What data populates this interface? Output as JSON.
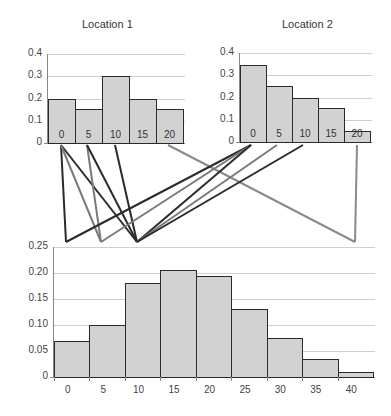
{
  "chart_data": [
    {
      "type": "bar",
      "title": "Location 1",
      "categories": [
        "0",
        "5",
        "10",
        "15",
        "20"
      ],
      "values": [
        0.2,
        0.155,
        0.3,
        0.2,
        0.155
      ],
      "yticks": [
        "0",
        "0.1",
        "0.2",
        "0.3",
        "0.4"
      ],
      "ylim": [
        0,
        0.4
      ],
      "grid": true,
      "xlabel": "",
      "ylabel": ""
    },
    {
      "type": "bar",
      "title": "Location 2",
      "categories": [
        "0",
        "5",
        "10",
        "15",
        "20"
      ],
      "values": [
        0.345,
        0.25,
        0.2,
        0.155,
        0.05
      ],
      "yticks": [
        "0",
        "0.1",
        "0.2",
        "0.3",
        "0.4"
      ],
      "ylim": [
        0,
        0.4
      ],
      "grid": true,
      "xlabel": "",
      "ylabel": ""
    },
    {
      "type": "bar",
      "title": "",
      "categories": [
        "0",
        "5",
        "10",
        "15",
        "20",
        "25",
        "30",
        "35",
        "40"
      ],
      "values": [
        0.07,
        0.1,
        0.18,
        0.205,
        0.195,
        0.13,
        0.075,
        0.035,
        0.01
      ],
      "yticks": [
        "0",
        "0.05",
        "0.10",
        "0.15",
        "0.20",
        "0.25"
      ],
      "ylim": [
        0,
        0.25
      ],
      "grid": true,
      "xlabel": "",
      "ylabel": ""
    }
  ],
  "connections": [
    {
      "from": "Location 1: 0",
      "to": "0",
      "color": "#2b2b2b"
    },
    {
      "from": "Location 1: 0",
      "to": "10",
      "color": "#2b2b2b"
    },
    {
      "from": "Location 1: 0",
      "to": "5",
      "color": "#7a7a7a"
    },
    {
      "from": "Location 1: 5",
      "to": "5",
      "color": "#7a7a7a"
    },
    {
      "from": "Location 1: 5",
      "to": "10",
      "color": "#2b2b2b"
    },
    {
      "from": "Location 1: 10",
      "to": "10",
      "color": "#2b2b2b"
    },
    {
      "from": "Location 1: 20",
      "to": "40",
      "color": "#8a8a8a"
    },
    {
      "from": "Location 2: 0",
      "to": "0",
      "color": "#2b2b2b"
    },
    {
      "from": "Location 2: 0",
      "to": "5",
      "color": "#7a7a7a"
    },
    {
      "from": "Location 2: 0",
      "to": "10",
      "color": "#2b2b2b"
    },
    {
      "from": "Location 2: 5",
      "to": "10",
      "color": "#7a7a7a"
    },
    {
      "from": "Location 2: 10",
      "to": "10",
      "color": "#2b2b2b"
    },
    {
      "from": "Location 2: 20",
      "to": "40",
      "color": "#8a8a8a"
    }
  ]
}
